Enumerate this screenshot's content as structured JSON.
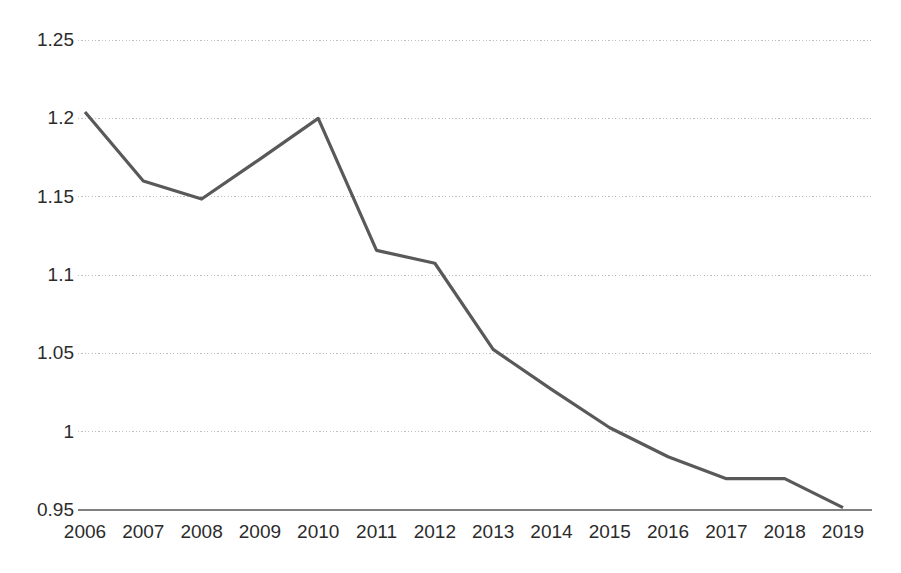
{
  "chart_data": {
    "type": "line",
    "title": "",
    "subtitle": "",
    "xlabel": "",
    "ylabel": "",
    "categories": [
      "2006",
      "2007",
      "2008",
      "2009",
      "2010",
      "2011",
      "2012",
      "2013",
      "2014",
      "2015",
      "2016",
      "2017",
      "2018",
      "2019"
    ],
    "values": [
      1.204,
      1.16,
      1.1485,
      1.174,
      1.2,
      1.1157,
      1.1075,
      1.0525,
      1.027,
      1.0025,
      0.984,
      0.97,
      0.97,
      0.9515
    ],
    "series": [
      {
        "name": "",
        "values": [
          1.204,
          1.16,
          1.1485,
          1.174,
          1.2,
          1.1157,
          1.1075,
          1.0525,
          1.027,
          1.0025,
          0.984,
          0.97,
          0.97,
          0.9515
        ]
      }
    ],
    "ylim": [
      0.95,
      1.25
    ],
    "xlim": [
      "2006",
      "2019"
    ],
    "y_ticks": [
      "1.25",
      "1.2",
      "1.15",
      "1.1",
      "1.05",
      "1",
      "0.95"
    ],
    "y_tick_values": [
      1.25,
      1.2,
      1.15,
      1.1,
      1.05,
      1.0,
      0.95
    ],
    "x_ticks": [
      "2006",
      "2007",
      "2008",
      "2009",
      "2010",
      "2011",
      "2012",
      "2013",
      "2014",
      "2015",
      "2016",
      "2017",
      "2018",
      "2019"
    ],
    "grid": "horizontal-dotted",
    "legend": "none",
    "annotations": [],
    "colors": {
      "line": "#595959",
      "grid": "#bfbfbf",
      "axis": "#808080",
      "tick_text": "#2b2b2b",
      "background": "#ffffff"
    },
    "line_width": 3.2,
    "markers": "none"
  }
}
